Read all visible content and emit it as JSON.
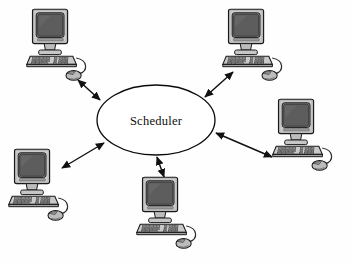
{
  "diagram": {
    "type": "network-topology",
    "title": "Scheduler",
    "background_color": "#fefefe",
    "hub": {
      "label": "Scheduler",
      "shape": "ellipse",
      "cx": 156,
      "cy": 120,
      "rx": 59,
      "ry": 35,
      "fill": "#ffffff",
      "stroke": "#0a0a0a"
    },
    "edges": [
      {
        "id": "edge-top-left",
        "from": "hub",
        "to": "node-top-left",
        "style": "double-headed-arrow",
        "color": "#111111"
      },
      {
        "id": "edge-top-right",
        "from": "hub",
        "to": "node-top-right",
        "style": "double-headed-arrow",
        "color": "#111111"
      },
      {
        "id": "edge-right",
        "from": "hub",
        "to": "node-right",
        "style": "double-headed-arrow",
        "color": "#111111"
      },
      {
        "id": "edge-bottom-left",
        "from": "hub",
        "to": "node-bottom-left",
        "style": "double-headed-arrow",
        "color": "#111111"
      },
      {
        "id": "edge-bottom-center",
        "from": "hub",
        "to": "node-bottom-center",
        "style": "double-headed-arrow",
        "color": "#111111"
      }
    ],
    "nodes": [
      {
        "id": "node-top-left",
        "icon": "desktop-computer-icon",
        "x": 26,
        "y": 8,
        "scale": 1.0
      },
      {
        "id": "node-top-right",
        "icon": "desktop-computer-icon",
        "x": 222,
        "y": 8,
        "scale": 1.0
      },
      {
        "id": "node-right",
        "icon": "desktop-computer-icon",
        "x": 272,
        "y": 98,
        "scale": 1.0
      },
      {
        "id": "node-bottom-left",
        "icon": "desktop-computer-icon",
        "x": 8,
        "y": 148,
        "scale": 1.0
      },
      {
        "id": "node-bottom-center",
        "icon": "desktop-computer-icon",
        "x": 136,
        "y": 176,
        "scale": 1.0
      }
    ],
    "palette": {
      "outline": "#1a1a1a",
      "bezel_light": "#cfcfcf",
      "bezel_mid": "#a8a8a8",
      "bezel_dark": "#7d7d7d",
      "screen": "#5e5e5e",
      "screen_dark": "#4a4a4a",
      "keyboard": "#bdbdbd",
      "key": "#8a8a8a",
      "mouse": "#b3b3b3",
      "cable": "#3a3a3a"
    }
  }
}
